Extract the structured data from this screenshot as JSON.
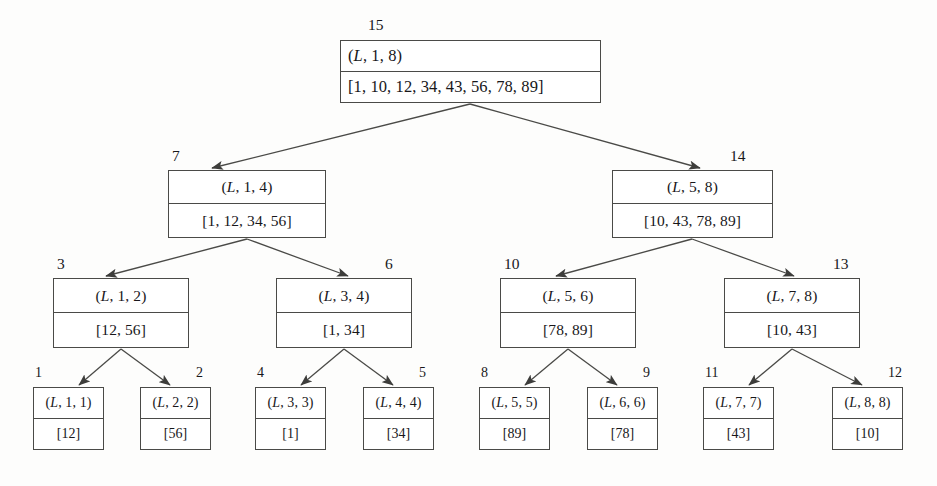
{
  "figure": {
    "kind": "binary-tree-diagram",
    "background_color": "#fdfdfc",
    "line_color": "#4a4a47",
    "text_color": "#18171a"
  },
  "nodes": [
    {
      "id": "n15",
      "index_label": "15",
      "header": "(L, 1, 8)",
      "values": "[1, 10, 12, 34, 43, 56, 78, 89]",
      "level": 0,
      "x": 340,
      "y": 40,
      "w": 261,
      "h": 63,
      "align": "left",
      "index_x": 368,
      "index_y": 17
    },
    {
      "id": "n7",
      "index_label": "7",
      "header": "(L, 1, 4)",
      "values": "[1, 12, 34, 56]",
      "level": 1,
      "x": 168,
      "y": 170,
      "w": 158,
      "h": 68,
      "align": "center",
      "index_x": 172,
      "index_y": 148
    },
    {
      "id": "n14",
      "index_label": "14",
      "header": "(L, 5, 8)",
      "values": "[10, 43, 78, 89]",
      "level": 1,
      "x": 612,
      "y": 170,
      "w": 161,
      "h": 68,
      "align": "center",
      "index_x": 730,
      "index_y": 148
    },
    {
      "id": "n3",
      "index_label": "3",
      "header": "(L, 1, 2)",
      "values": "[12, 56]",
      "level": 2,
      "x": 53,
      "y": 278,
      "w": 136,
      "h": 70,
      "align": "center",
      "index_x": 57,
      "index_y": 256
    },
    {
      "id": "n6",
      "index_label": "6",
      "header": "(L, 3, 4)",
      "values": "[1, 34]",
      "level": 2,
      "x": 276,
      "y": 278,
      "w": 136,
      "h": 70,
      "align": "center",
      "index_x": 385,
      "index_y": 256
    },
    {
      "id": "n10",
      "index_label": "10",
      "header": "(L, 5, 6)",
      "values": "[78, 89]",
      "level": 2,
      "x": 500,
      "y": 278,
      "w": 136,
      "h": 70,
      "align": "center",
      "index_x": 504,
      "index_y": 256
    },
    {
      "id": "n13",
      "index_label": "13",
      "header": "(L, 7, 8)",
      "values": "[10, 43]",
      "level": 2,
      "x": 724,
      "y": 278,
      "w": 136,
      "h": 70,
      "align": "center",
      "index_x": 833,
      "index_y": 256
    },
    {
      "id": "n1",
      "index_label": "1",
      "header": "(L, 1, 1)",
      "values": "[12]",
      "level": 3,
      "x": 33,
      "y": 387,
      "w": 71,
      "h": 63,
      "align": "center",
      "index_x": 35,
      "index_y": 366
    },
    {
      "id": "n2",
      "index_label": "2",
      "header": "(L, 2, 2)",
      "values": "[56]",
      "level": 3,
      "x": 140,
      "y": 387,
      "w": 71,
      "h": 63,
      "align": "center",
      "index_x": 196,
      "index_y": 366
    },
    {
      "id": "n4",
      "index_label": "4",
      "header": "(L, 3, 3)",
      "values": "[1]",
      "level": 3,
      "x": 255,
      "y": 387,
      "w": 71,
      "h": 63,
      "align": "center",
      "index_x": 257,
      "index_y": 366
    },
    {
      "id": "n5",
      "index_label": "5",
      "header": "(L, 4, 4)",
      "values": "[34]",
      "level": 3,
      "x": 363,
      "y": 387,
      "w": 71,
      "h": 63,
      "align": "center",
      "index_x": 419,
      "index_y": 366
    },
    {
      "id": "n8",
      "index_label": "8",
      "header": "(L, 5, 5)",
      "values": "[89]",
      "level": 3,
      "x": 479,
      "y": 387,
      "w": 71,
      "h": 63,
      "align": "center",
      "index_x": 481,
      "index_y": 366
    },
    {
      "id": "n9",
      "index_label": "9",
      "header": "(L, 6, 6)",
      "values": "[78]",
      "level": 3,
      "x": 587,
      "y": 387,
      "w": 71,
      "h": 63,
      "align": "center",
      "index_x": 643,
      "index_y": 366
    },
    {
      "id": "n11",
      "index_label": "11",
      "header": "(L, 7, 7)",
      "values": "[43]",
      "level": 3,
      "x": 703,
      "y": 387,
      "w": 71,
      "h": 63,
      "align": "center",
      "index_x": 705,
      "index_y": 366
    },
    {
      "id": "n12",
      "index_label": "12",
      "header": "(L, 8, 8)",
      "values": "[10]",
      "level": 3,
      "x": 832,
      "y": 387,
      "w": 71,
      "h": 63,
      "align": "center",
      "index_x": 888,
      "index_y": 366
    }
  ],
  "edges": [
    {
      "from": "n15",
      "to": "n7",
      "x1": 470,
      "y1": 104,
      "x2": 212,
      "y2": 168
    },
    {
      "from": "n15",
      "to": "n14",
      "x1": 470,
      "y1": 104,
      "x2": 700,
      "y2": 168
    },
    {
      "from": "n7",
      "to": "n3",
      "x1": 247,
      "y1": 239,
      "x2": 106,
      "y2": 276
    },
    {
      "from": "n7",
      "to": "n6",
      "x1": 247,
      "y1": 239,
      "x2": 348,
      "y2": 276
    },
    {
      "from": "n14",
      "to": "n10",
      "x1": 692,
      "y1": 239,
      "x2": 556,
      "y2": 276
    },
    {
      "from": "n14",
      "to": "n13",
      "x1": 692,
      "y1": 239,
      "x2": 794,
      "y2": 276
    },
    {
      "from": "n3",
      "to": "n1",
      "x1": 121,
      "y1": 349,
      "x2": 79,
      "y2": 385
    },
    {
      "from": "n3",
      "to": "n2",
      "x1": 121,
      "y1": 349,
      "x2": 170,
      "y2": 385
    },
    {
      "from": "n6",
      "to": "n4",
      "x1": 344,
      "y1": 349,
      "x2": 301,
      "y2": 385
    },
    {
      "from": "n6",
      "to": "n5",
      "x1": 344,
      "y1": 349,
      "x2": 393,
      "y2": 385
    },
    {
      "from": "n10",
      "to": "n8",
      "x1": 568,
      "y1": 349,
      "x2": 525,
      "y2": 385
    },
    {
      "from": "n10",
      "to": "n9",
      "x1": 568,
      "y1": 349,
      "x2": 617,
      "y2": 385
    },
    {
      "from": "n13",
      "to": "n11",
      "x1": 792,
      "y1": 349,
      "x2": 749,
      "y2": 385
    },
    {
      "from": "n13",
      "to": "n12",
      "x1": 792,
      "y1": 349,
      "x2": 862,
      "y2": 385
    }
  ]
}
